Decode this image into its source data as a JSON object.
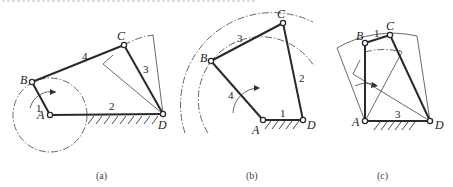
{
  "figure": {
    "panels": [
      {
        "caption": "(a)",
        "points": {
          "A": "A",
          "B": "B",
          "C": "C",
          "D": "D"
        },
        "links": {
          "l1": "1",
          "l2": "2",
          "l3": "3",
          "l4": "4"
        }
      },
      {
        "caption": "(b)",
        "points": {
          "A": "A",
          "B": "B",
          "C": "C",
          "D": "D"
        },
        "links": {
          "l1": "1",
          "l2": "2",
          "l3": "3",
          "l4": "4"
        }
      },
      {
        "caption": "(c)",
        "points": {
          "A": "A",
          "B": "B",
          "C": "C",
          "D": "D"
        },
        "links": {
          "l1": "1",
          "l3": "3"
        }
      }
    ]
  },
  "colors": {
    "line": "#2a2a2a",
    "background": "#ffffff"
  }
}
